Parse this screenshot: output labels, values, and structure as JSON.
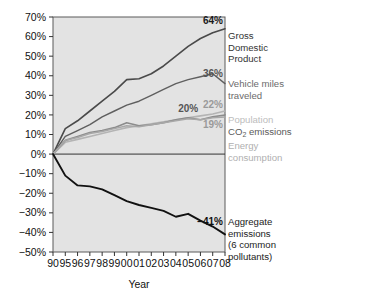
{
  "chart_data": {
    "type": "line",
    "title": "",
    "subtitle": "",
    "xlabel": "Year",
    "ylabel": "",
    "grid": false,
    "legend_position": "right-inline",
    "x": [
      "90",
      "95",
      "96",
      "97",
      "98",
      "99",
      "00",
      "01",
      "02",
      "03",
      "04",
      "05",
      "06",
      "07",
      "08"
    ],
    "xlim": [
      0,
      14
    ],
    "ylim": [
      -50,
      70
    ],
    "yticks": [
      "70%",
      "60%",
      "50%",
      "40%",
      "30%",
      "20%",
      "10%",
      "0%",
      "−10%",
      "−20%",
      "−30%",
      "−40%",
      "−50%"
    ],
    "ytick_values": [
      70,
      60,
      50,
      40,
      30,
      20,
      10,
      0,
      -10,
      -20,
      -30,
      -40,
      -50
    ],
    "zero_line": 0,
    "series": [
      {
        "name": "Gross Domestic Product",
        "color": "#4a4a4a",
        "width": 1.6,
        "end_value": 64,
        "end_label": "64%",
        "values": [
          0,
          13,
          17,
          22,
          27,
          32,
          38,
          38.5,
          41,
          45,
          50,
          55,
          59,
          62,
          64
        ]
      },
      {
        "name": "Vehicle miles traveled",
        "color": "#5f5f5f",
        "width": 1.4,
        "end_value": 36,
        "end_label": "36%",
        "values": [
          0,
          9,
          12,
          15,
          19,
          22,
          25,
          27,
          30,
          33,
          36,
          38,
          39.5,
          41,
          36
        ]
      },
      {
        "name": "Population",
        "color": "#b4b4b4",
        "width": 1.6,
        "end_value": 22,
        "end_label": "22%",
        "values": [
          0,
          6,
          7.5,
          9,
          10.5,
          12,
          13.5,
          14.5,
          15.5,
          16.5,
          17.5,
          18.5,
          19.5,
          20.5,
          22
        ]
      },
      {
        "name": "CO2 emissions",
        "color": "#8c8c8c",
        "width": 1.6,
        "end_value": 20,
        "end_label": "20%",
        "values": [
          0,
          7,
          9,
          11,
          12,
          13.5,
          16,
          14.5,
          15,
          16,
          17.5,
          18.5,
          17.5,
          19,
          20
        ]
      },
      {
        "name": "Energy consumption",
        "color": "#a8a8a8",
        "width": 1.5,
        "end_value": 19,
        "end_label": "19%",
        "values": [
          0,
          7,
          8.5,
          10.5,
          11.5,
          13,
          14.5,
          14,
          15,
          16,
          17,
          18,
          17.5,
          18.5,
          19
        ]
      },
      {
        "name": "Aggregate emissions (6 common pollutants)",
        "color": "#111111",
        "width": 1.9,
        "end_value": -41,
        "end_label": "−41%",
        "values": [
          0,
          -11,
          -16,
          -16.5,
          -18,
          -21,
          -24,
          -26,
          -27.5,
          -29,
          -32,
          -30.5,
          -34,
          -37,
          -41
        ]
      }
    ],
    "annotations": [
      {
        "text": "20%",
        "series": "CO2 emissions",
        "color": "#555555"
      }
    ]
  },
  "legend": {
    "items": [
      {
        "value": "64%",
        "value_color": "#1a1a1a",
        "label_color": "#333333",
        "lines": [
          "Gross",
          "Domestic",
          "Product"
        ]
      },
      {
        "value": "36%",
        "value_color": "#555555",
        "label_color": "#6b6b6b",
        "lines": [
          "Vehicle miles",
          "traveled"
        ]
      },
      {
        "value": "22%",
        "value_color": "#9a9a9a",
        "label_color": "#bdbdbd",
        "lines": [
          "Population"
        ]
      },
      {
        "value": "",
        "value_color": "#6f6f6f",
        "label_color": "#5a5a5a",
        "lines": [
          "CO2 emissions"
        ]
      },
      {
        "value": "19%",
        "value_color": "#9a9a9a",
        "label_color": "#b0b0b0",
        "lines": [
          "Energy",
          "consumption"
        ]
      },
      {
        "value": "−41%",
        "value_color": "#111111",
        "label_color": "#222222",
        "lines": [
          "Aggregate",
          "emissions",
          "(6 common",
          "pollutants)"
        ]
      }
    ]
  },
  "axis": {
    "x_title": "Year"
  },
  "style": {
    "plot_background": "#e3e3e3",
    "page_background": "#ffffff",
    "frame_color": "#5a5a5a",
    "text_color": "#111111"
  }
}
